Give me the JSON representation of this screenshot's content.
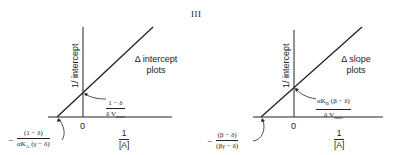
{
  "figure": {
    "panel_label": "III",
    "left_plot": {
      "y_axis_label": "1/ intercept",
      "x_axis_origin": "0",
      "x_axis_label": {
        "numerator": "1",
        "denominator": "[A]"
      },
      "series_label_line1": "Δ intercept",
      "series_label_line2": "plots",
      "y_intercept": {
        "numerator": "1 − δ",
        "denominator": "δ V",
        "denominator_sub": "max"
      },
      "x_intercept": {
        "sign": "−",
        "numerator": "(1 − δ)",
        "denominator": "αK",
        "denominator_sub": "A",
        "denominator_tail": " (γ − δ)"
      }
    },
    "right_plot": {
      "y_axis_label": "1/ intercept",
      "x_axis_origin": "0",
      "x_axis_label": {
        "numerator": "1",
        "denominator": "[A]"
      },
      "series_label_line1": "Δ slope",
      "series_label_line2": "plots",
      "y_intercept": {
        "numerator_pre": "αK",
        "numerator_sub": "B",
        "numerator_tail": " (β − δ)",
        "denominator": "δ V",
        "denominator_sub": "max"
      },
      "x_intercept": {
        "sign": "−",
        "numerator": "(β − δ)",
        "denominator": "(βγ − δ)"
      }
    },
    "colors": {
      "line": "#222222",
      "background": "#ffffff"
    }
  }
}
